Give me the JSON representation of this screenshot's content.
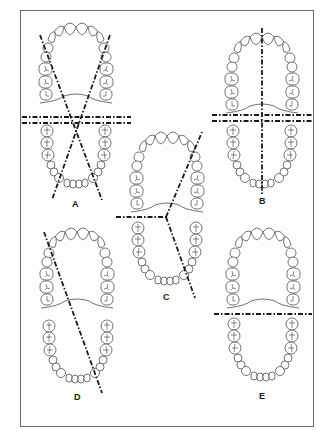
{
  "figure": {
    "type": "dental arch sectioning diagram",
    "border_color": "#6a6a6a",
    "line_color": "#1a1a1a",
    "panels": [
      {
        "id": "A",
        "label": "A",
        "cuts": [
          "diagonal left",
          "diagonal right",
          "horizontal double"
        ]
      },
      {
        "id": "B",
        "label": "B",
        "cuts": [
          "vertical midline",
          "horizontal double"
        ]
      },
      {
        "id": "C",
        "label": "C",
        "cuts": [
          "horizontal half-left",
          "diagonal from center"
        ]
      },
      {
        "id": "D",
        "label": "D",
        "cuts": [
          "single diagonal"
        ]
      },
      {
        "id": "E",
        "label": "E",
        "cuts": [
          "horizontal single"
        ]
      }
    ]
  }
}
